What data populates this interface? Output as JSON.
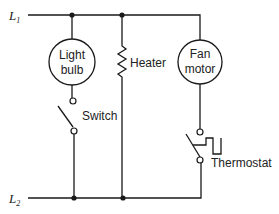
{
  "diagram": {
    "type": "circuit-schematic",
    "rails": {
      "top": {
        "label": "L",
        "subscript": "1"
      },
      "bottom": {
        "label": "L",
        "subscript": "2"
      }
    },
    "components": {
      "light_bulb": {
        "line1": "Light",
        "line2": "bulb"
      },
      "switch": {
        "label": "Switch"
      },
      "heater": {
        "label": "Heater"
      },
      "fan_motor": {
        "line1": "Fan",
        "line2": "motor"
      },
      "thermostat": {
        "label": "Thermostat"
      }
    },
    "colors": {
      "ink": "#1a1a1a",
      "background": "#ffffff"
    }
  }
}
